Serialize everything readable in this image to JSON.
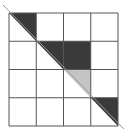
{
  "diagram": {
    "type": "grid-with-diagonal",
    "rows": 4,
    "cols": 4,
    "grid": {
      "x0": 9,
      "y0": 13,
      "x1": 118,
      "y1": 126
    },
    "colors": {
      "background": "#ffffff",
      "grid_line": "#555555",
      "dark_fill": "#3a3a3a",
      "light_fill": "#c4c4c4",
      "diagonal": "#9a9a9a"
    },
    "diagonal": {
      "from": [
        3,
        5
      ],
      "to": [
        124,
        129
      ]
    },
    "shaded_cells": [
      {
        "row": 0,
        "col": 0,
        "shape": "upper-right-triangle",
        "fill": "dark"
      },
      {
        "row": 1,
        "col": 1,
        "shape": "upper-right-triangle",
        "fill": "dark"
      },
      {
        "row": 1,
        "col": 2,
        "shape": "square",
        "fill": "dark"
      },
      {
        "row": 2,
        "col": 2,
        "shape": "upper-right-triangle",
        "fill": "light"
      },
      {
        "row": 3,
        "col": 3,
        "shape": "upper-right-triangle",
        "fill": "dark"
      }
    ]
  }
}
